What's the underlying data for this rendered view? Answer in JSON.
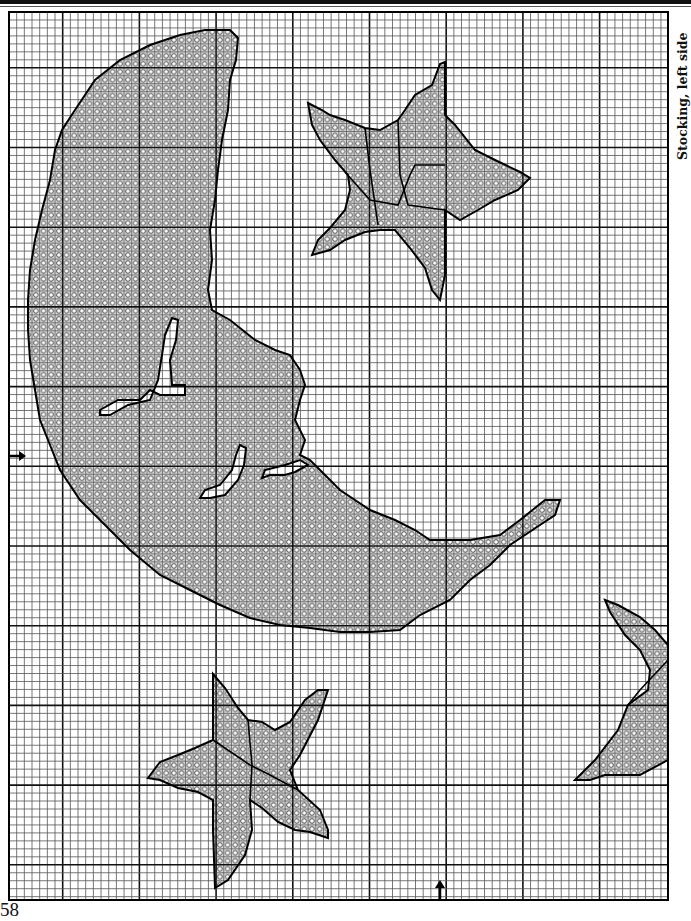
{
  "page": {
    "title": "Stocking, left side",
    "page_number": "58"
  },
  "grid": {
    "left": 9,
    "top": 12,
    "right": 668,
    "bottom": 900,
    "cell_w": 7.67,
    "cell_h": 7.97,
    "major_every": 10,
    "major_x_offset": 7,
    "major_y_offset": 7,
    "line_color": "#555555",
    "major_color": "#111111",
    "fill_color": "#d9d9d9",
    "outline_color": "#000000"
  },
  "markers": {
    "left_center_arrow": {
      "x": 12,
      "y": 456,
      "direction": "right"
    },
    "bottom_center_arrow": {
      "x": 440,
      "y": 898,
      "direction": "up"
    }
  },
  "legend": {
    "symbol": "open-circle",
    "meaning": "stitch"
  },
  "shapes": [
    {
      "name": "moon",
      "points": "230,30 238,38 236,60 230,80 228,110 222,140 218,170 215,200 210,230 212,260 208,290 212,310 230,320 255,340 275,350 290,355 300,370 305,385 300,400 295,420 305,440 300,455 310,460 320,470 340,490 370,510 395,520 415,530 430,540 470,540 500,535 520,520 545,500 560,500 555,515 540,525 510,545 490,565 470,580 450,600 420,615 400,630 370,632 340,632 310,628 280,625 250,618 220,605 190,590 160,575 130,550 100,520 80,500 60,470 50,445 40,420 35,390 30,360 28,330 28,300 30,270 35,240 42,210 50,180 55,150 62,130 75,110 95,80 120,60 150,45 180,35 205,30"
    },
    {
      "name": "moon-cutout-1",
      "points": "172,318 178,320 176,340 170,360 172,385 185,385 185,395 160,395 150,390 140,400 118,400 100,410 100,415 110,415 128,405 150,400 158,380 162,355 165,335"
    },
    {
      "name": "moon-cutout-2",
      "points": "240,445 246,448 244,465 238,480 225,495 210,498 200,498 205,490 220,485 232,470 236,455"
    },
    {
      "name": "moon-cutout-3",
      "points": "285,465 300,460 308,465 295,472 285,475 270,475 262,478 265,470"
    },
    {
      "name": "star-top",
      "points": "308,103 322,110 330,115 345,120 365,128 380,130 398,120 405,110 415,95 432,85 440,64 445,62 445,115 455,125 475,150 495,160 520,172 530,178 518,190 495,200 478,210 460,220 445,210 445,275 440,300 432,290 425,268 410,248 395,230 380,230 365,232 345,240 330,250 312,255 318,240 330,228 345,210 350,190 348,175 335,160 320,140 312,125"
    },
    {
      "name": "star-bottom",
      "points": "213,674 225,688 238,708 248,720 262,722 275,730 290,722 305,700 318,690 328,690 318,720 300,755 290,770 298,790 320,810 328,830 328,838 310,832 295,830 278,822 262,808 250,800 252,830 245,855 228,880 215,888 213,830 213,800 198,792 178,788 160,780 148,778 160,762 178,755 195,748 213,740"
    },
    {
      "name": "star-partial-right",
      "points": "605,600 618,605 640,617 655,630 668,645 668,760 640,775 605,775 590,780 575,780 595,760 618,730 628,705 648,690 650,670 640,650 625,635 610,612"
    }
  ],
  "shape_inner_lines": [
    {
      "shape": "star-top",
      "points": "345,172 370,200 398,205 410,175 415,165 445,165"
    },
    {
      "shape": "star-top",
      "points": "365,128 370,170 378,225"
    },
    {
      "shape": "star-top",
      "points": "398,120 400,175 408,205 445,210"
    },
    {
      "shape": "star-bottom",
      "points": "213,740 250,765 270,775 298,790"
    },
    {
      "shape": "star-bottom",
      "points": "248,720 252,765 250,800"
    },
    {
      "shape": "star-partial-right",
      "points": "628,705 640,690 668,660"
    }
  ]
}
